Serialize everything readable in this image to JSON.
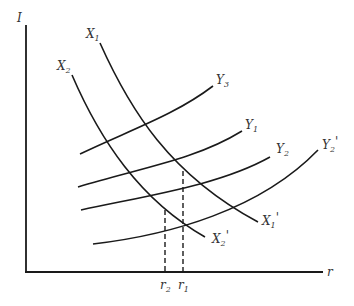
{
  "diagram": {
    "type": "economics-curve-diagram",
    "axes": {
      "y_label": "I",
      "x_label": "r"
    },
    "curves": {
      "X1": {
        "start_label": "X",
        "start_sub": "1",
        "end_label": "X",
        "end_sub": "1",
        "end_prime": "'"
      },
      "X2": {
        "start_label": "X",
        "start_sub": "2",
        "end_label": "X",
        "end_sub": "2",
        "end_prime": "'"
      },
      "Y3": {
        "label": "Y",
        "sub": "3"
      },
      "Y1": {
        "label": "Y",
        "sub": "1"
      },
      "Y2": {
        "label": "Y",
        "sub": "2"
      },
      "Y2p": {
        "label": "Y",
        "sub": "2",
        "prime": "'"
      }
    },
    "ticks": {
      "r2": {
        "label": "r",
        "sub": "2"
      },
      "r1": {
        "label": "r",
        "sub": "1"
      }
    },
    "colors": {
      "line": "#1a1a1a",
      "text": "#333333",
      "background": "#ffffff"
    }
  }
}
